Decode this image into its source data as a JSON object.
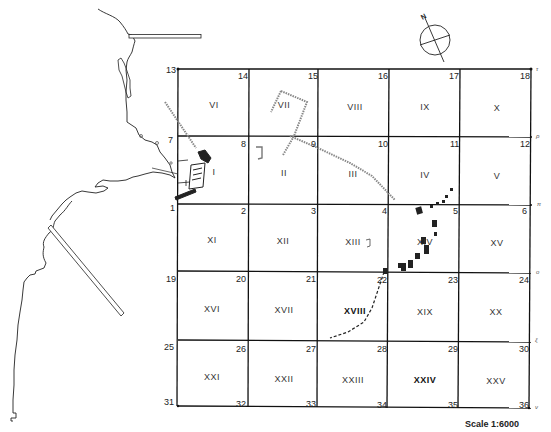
{
  "map": {
    "title": "",
    "scale_label": "Scale 1:6000",
    "north_label": "N",
    "grid": {
      "x_lines": [
        178,
        249,
        318,
        389,
        460,
        531
      ],
      "y_lines": [
        69,
        136,
        204,
        271,
        340,
        406
      ],
      "corner_numbers": [
        {
          "n": "13",
          "x": 166,
          "y": 66,
          "side": "left"
        },
        {
          "n": "14",
          "x": 238,
          "y": 72
        },
        {
          "n": "15",
          "x": 308,
          "y": 72
        },
        {
          "n": "16",
          "x": 378,
          "y": 72
        },
        {
          "n": "17",
          "x": 449,
          "y": 72
        },
        {
          "n": "18",
          "x": 520,
          "y": 72
        },
        {
          "n": "7",
          "x": 168,
          "y": 136,
          "side": "left"
        },
        {
          "n": "8",
          "x": 241,
          "y": 140
        },
        {
          "n": "9",
          "x": 311,
          "y": 140
        },
        {
          "n": "10",
          "x": 378,
          "y": 140
        },
        {
          "n": "11",
          "x": 450,
          "y": 140
        },
        {
          "n": "12",
          "x": 520,
          "y": 140
        },
        {
          "n": "1",
          "x": 170,
          "y": 204,
          "side": "left"
        },
        {
          "n": "2",
          "x": 241,
          "y": 207
        },
        {
          "n": "3",
          "x": 311,
          "y": 207
        },
        {
          "n": "4",
          "x": 382,
          "y": 207
        },
        {
          "n": "5",
          "x": 453,
          "y": 207
        },
        {
          "n": "6",
          "x": 522,
          "y": 207
        },
        {
          "n": "19",
          "x": 166,
          "y": 275,
          "side": "left"
        },
        {
          "n": "20",
          "x": 236,
          "y": 275
        },
        {
          "n": "21",
          "x": 306,
          "y": 275
        },
        {
          "n": "22",
          "x": 377,
          "y": 276
        },
        {
          "n": "23",
          "x": 448,
          "y": 276
        },
        {
          "n": "24",
          "x": 519,
          "y": 276
        },
        {
          "n": "25",
          "x": 164,
          "y": 343,
          "side": "left"
        },
        {
          "n": "26",
          "x": 236,
          "y": 345
        },
        {
          "n": "27",
          "x": 306,
          "y": 345
        },
        {
          "n": "28",
          "x": 377,
          "y": 345
        },
        {
          "n": "29",
          "x": 448,
          "y": 345
        },
        {
          "n": "30",
          "x": 519,
          "y": 345
        },
        {
          "n": "31",
          "x": 164,
          "y": 398,
          "side": "left"
        },
        {
          "n": "32",
          "x": 236,
          "y": 400
        },
        {
          "n": "33",
          "x": 306,
          "y": 400
        },
        {
          "n": "34",
          "x": 377,
          "y": 401
        },
        {
          "n": "35",
          "x": 448,
          "y": 401
        },
        {
          "n": "36",
          "x": 519,
          "y": 401
        }
      ],
      "cells": [
        {
          "label": "VI",
          "x": 214,
          "y": 105
        },
        {
          "label": "VII",
          "x": 284,
          "y": 105
        },
        {
          "label": "VIII",
          "x": 355,
          "y": 107
        },
        {
          "label": "IX",
          "x": 425,
          "y": 107
        },
        {
          "label": "X",
          "x": 497,
          "y": 108
        },
        {
          "label": "I",
          "x": 214,
          "y": 172
        },
        {
          "label": "II",
          "x": 284,
          "y": 173
        },
        {
          "label": "III",
          "x": 353,
          "y": 174
        },
        {
          "label": "IV",
          "x": 425,
          "y": 175
        },
        {
          "label": "V",
          "x": 497,
          "y": 176
        },
        {
          "label": "XI",
          "x": 212,
          "y": 240
        },
        {
          "label": "XII",
          "x": 283,
          "y": 241
        },
        {
          "label": "XIII",
          "x": 353,
          "y": 242
        },
        {
          "label": "XIV",
          "x": 425,
          "y": 242
        },
        {
          "label": "XV",
          "x": 497,
          "y": 243
        },
        {
          "label": "XVI",
          "x": 212,
          "y": 309
        },
        {
          "label": "XVII",
          "x": 284,
          "y": 310
        },
        {
          "label": "XVIII",
          "x": 355,
          "y": 311,
          "bold": true
        },
        {
          "label": "XIX",
          "x": 425,
          "y": 312
        },
        {
          "label": "XX",
          "x": 496,
          "y": 312
        },
        {
          "label": "XXI",
          "x": 212,
          "y": 377
        },
        {
          "label": "XXII",
          "x": 284,
          "y": 379
        },
        {
          "label": "XXIII",
          "x": 353,
          "y": 380
        },
        {
          "label": "XXIV",
          "x": 425,
          "y": 380,
          "bold": true
        },
        {
          "label": "XXV",
          "x": 496,
          "y": 381
        }
      ],
      "edge_marks": [
        {
          "t": "τ",
          "x": 536,
          "y": 66
        },
        {
          "t": "ρ",
          "x": 536,
          "y": 133
        },
        {
          "t": "π",
          "x": 537,
          "y": 201
        },
        {
          "t": "o",
          "x": 536,
          "y": 269
        },
        {
          "t": "ξ",
          "x": 535,
          "y": 337
        },
        {
          "t": "ν",
          "x": 535,
          "y": 404
        }
      ]
    }
  }
}
